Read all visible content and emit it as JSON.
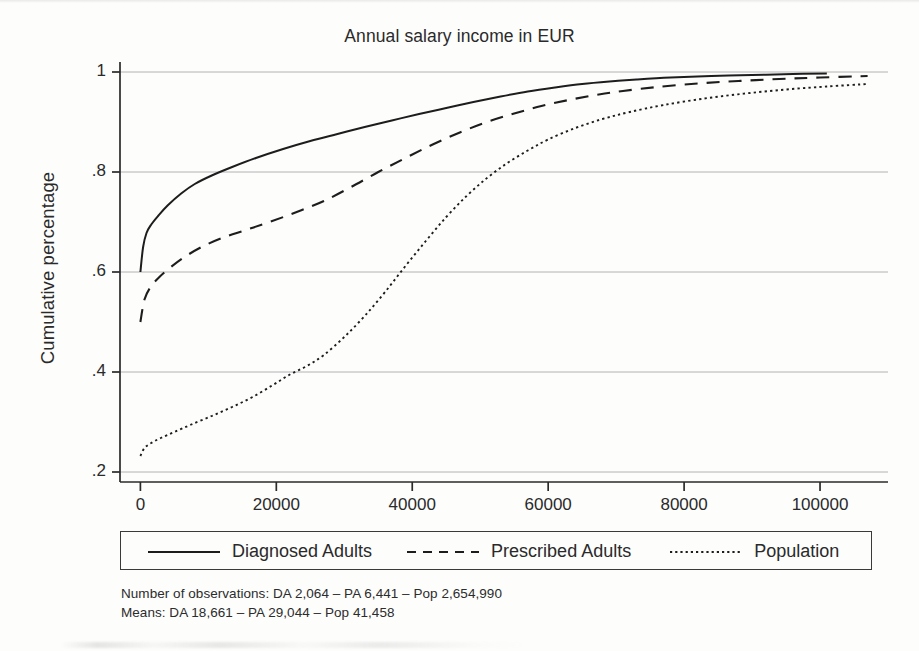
{
  "chart_data": {
    "type": "line",
    "title": "Annual salary income in EUR",
    "xlabel": "",
    "ylabel": "Cumulative percentage",
    "xlim": [
      -3000,
      110000
    ],
    "ylim": [
      0.18,
      1.02
    ],
    "xticks": [
      0,
      20000,
      40000,
      60000,
      80000,
      100000
    ],
    "xticklabels": [
      "0",
      "20000",
      "40000",
      "60000",
      "80000",
      "100000"
    ],
    "yticks": [
      0.2,
      0.4,
      0.6,
      0.8,
      1
    ],
    "yticklabels": [
      ".2",
      ".4",
      ".6",
      ".8",
      "1"
    ],
    "grid": "horizontal",
    "legend_position": "below-axes",
    "series": [
      {
        "name": "Diagnosed Adults",
        "style": "solid",
        "color": "#1d1d1d",
        "points": [
          [
            0,
            0.6
          ],
          [
            400,
            0.65
          ],
          [
            900,
            0.678
          ],
          [
            1600,
            0.695
          ],
          [
            2600,
            0.712
          ],
          [
            4000,
            0.733
          ],
          [
            6000,
            0.757
          ],
          [
            8000,
            0.776
          ],
          [
            10500,
            0.793
          ],
          [
            13500,
            0.81
          ],
          [
            17000,
            0.828
          ],
          [
            21000,
            0.846
          ],
          [
            25000,
            0.862
          ],
          [
            29000,
            0.876
          ],
          [
            33000,
            0.89
          ],
          [
            37000,
            0.903
          ],
          [
            41000,
            0.916
          ],
          [
            45000,
            0.928
          ],
          [
            49000,
            0.94
          ],
          [
            53000,
            0.951
          ],
          [
            57000,
            0.961
          ],
          [
            61000,
            0.969
          ],
          [
            65000,
            0.976
          ],
          [
            69000,
            0.981
          ],
          [
            73000,
            0.985
          ],
          [
            78000,
            0.989
          ],
          [
            84000,
            0.992
          ],
          [
            90000,
            0.994
          ],
          [
            96000,
            0.996
          ],
          [
            101000,
            0.997
          ]
        ]
      },
      {
        "name": "Prescribed Adults",
        "style": "dashed",
        "color": "#1d1d1d",
        "points": [
          [
            0,
            0.5
          ],
          [
            600,
            0.545
          ],
          [
            1500,
            0.57
          ],
          [
            2800,
            0.59
          ],
          [
            4500,
            0.61
          ],
          [
            6500,
            0.63
          ],
          [
            9000,
            0.65
          ],
          [
            12000,
            0.668
          ],
          [
            15500,
            0.684
          ],
          [
            19000,
            0.7
          ],
          [
            23000,
            0.72
          ],
          [
            27000,
            0.742
          ],
          [
            31000,
            0.77
          ],
          [
            35000,
            0.8
          ],
          [
            39000,
            0.828
          ],
          [
            43000,
            0.855
          ],
          [
            47000,
            0.879
          ],
          [
            51000,
            0.9
          ],
          [
            55000,
            0.917
          ],
          [
            59000,
            0.932
          ],
          [
            63000,
            0.944
          ],
          [
            67000,
            0.954
          ],
          [
            71000,
            0.962
          ],
          [
            76000,
            0.97
          ],
          [
            82000,
            0.977
          ],
          [
            88000,
            0.982
          ],
          [
            94000,
            0.986
          ],
          [
            100000,
            0.989
          ],
          [
            107000,
            0.992
          ]
        ]
      },
      {
        "name": "Population",
        "style": "dotted",
        "color": "#1d1d1d",
        "points": [
          [
            0,
            0.232
          ],
          [
            600,
            0.248
          ],
          [
            1600,
            0.258
          ],
          [
            3000,
            0.268
          ],
          [
            5000,
            0.28
          ],
          [
            7500,
            0.295
          ],
          [
            10500,
            0.312
          ],
          [
            13500,
            0.33
          ],
          [
            16500,
            0.35
          ],
          [
            19500,
            0.374
          ],
          [
            22000,
            0.395
          ],
          [
            24500,
            0.412
          ],
          [
            27000,
            0.434
          ],
          [
            30000,
            0.47
          ],
          [
            33000,
            0.512
          ],
          [
            36000,
            0.56
          ],
          [
            39000,
            0.612
          ],
          [
            42000,
            0.662
          ],
          [
            45000,
            0.71
          ],
          [
            48000,
            0.752
          ],
          [
            51000,
            0.788
          ],
          [
            54000,
            0.818
          ],
          [
            57000,
            0.843
          ],
          [
            60000,
            0.865
          ],
          [
            64000,
            0.888
          ],
          [
            68000,
            0.906
          ],
          [
            72000,
            0.92
          ],
          [
            77000,
            0.934
          ],
          [
            83000,
            0.947
          ],
          [
            89000,
            0.957
          ],
          [
            95000,
            0.965
          ],
          [
            101000,
            0.971
          ],
          [
            107000,
            0.976
          ]
        ]
      }
    ],
    "annotations": [
      "Number of observations: DA 2,064 – PA 6,441 – Pop 2,654,990",
      "Means: DA 18,661 – PA 29,044 – Pop 41,458"
    ]
  },
  "legend": {
    "entries": [
      {
        "label": "Diagnosed Adults",
        "style": "solid"
      },
      {
        "label": "Prescribed Adults",
        "style": "dashed"
      },
      {
        "label": "Population",
        "style": "dotted"
      }
    ]
  },
  "footnotes": {
    "line1": "Number of observations: DA 2,064 – PA 6,441 – Pop 2,654,990",
    "line2": "Means: DA 18,661 – PA 29,044 – Pop 41,458"
  },
  "colors": {
    "ink": "#1d1d1d",
    "grid": "#9a9a9a",
    "axis": "#2a2a2a",
    "background": "#fdfdfc"
  }
}
